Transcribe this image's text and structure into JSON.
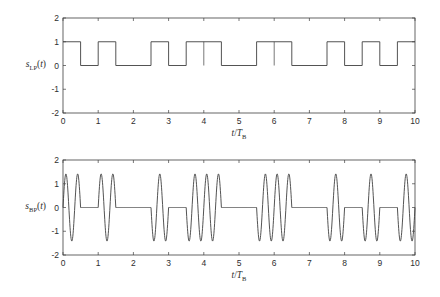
{
  "figure": {
    "background": "#ffffff",
    "line_color": "#3f3f3f",
    "text_color": "#2e2e2e"
  },
  "chart_data": [
    {
      "type": "line",
      "name": "lowpass",
      "title": "",
      "ylabel": {
        "sym": "s",
        "sub": "LP",
        "open": "(",
        "arg": "t",
        "close": ")"
      },
      "xlabel": {
        "num": "t",
        "slash": "/",
        "den": "T",
        "sub": "B"
      },
      "xlim": [
        0,
        10
      ],
      "ylim": [
        -2,
        2
      ],
      "xticks": [
        0,
        1,
        2,
        3,
        4,
        5,
        6,
        7,
        8,
        9,
        10
      ],
      "yticks": [
        2,
        1,
        0,
        -1,
        -2
      ],
      "grid": false,
      "waveform": "nrz-square",
      "slot_width": 0.5,
      "bits": [
        1,
        0,
        1,
        0,
        0,
        1,
        0,
        1,
        1,
        0,
        0,
        1,
        1,
        0,
        0,
        1,
        0,
        1,
        0,
        1
      ],
      "levels": {
        "one": 1,
        "zero": 0
      },
      "transition_ticks": [
        4,
        6
      ]
    },
    {
      "type": "line",
      "name": "bandpass",
      "title": "",
      "ylabel": {
        "sym": "s",
        "sub": "BP",
        "open": "(",
        "arg": "t",
        "close": ")"
      },
      "xlabel": {
        "num": "t",
        "slash": "/",
        "den": "T",
        "sub": "B"
      },
      "xlim": [
        0,
        10
      ],
      "ylim": [
        -2,
        2
      ],
      "xticks": [
        0,
        1,
        2,
        3,
        4,
        5,
        6,
        7,
        8,
        9,
        10
      ],
      "yticks": [
        2,
        1,
        0,
        -1,
        -2
      ],
      "grid": false,
      "waveform": "gated-sine",
      "slot_width": 0.5,
      "bits": [
        1,
        0,
        1,
        0,
        0,
        1,
        0,
        1,
        1,
        0,
        0,
        1,
        1,
        0,
        0,
        1,
        0,
        1,
        0,
        1
      ],
      "amplitude": 1.414,
      "carrier_cycles_per_unit": 3
    }
  ]
}
